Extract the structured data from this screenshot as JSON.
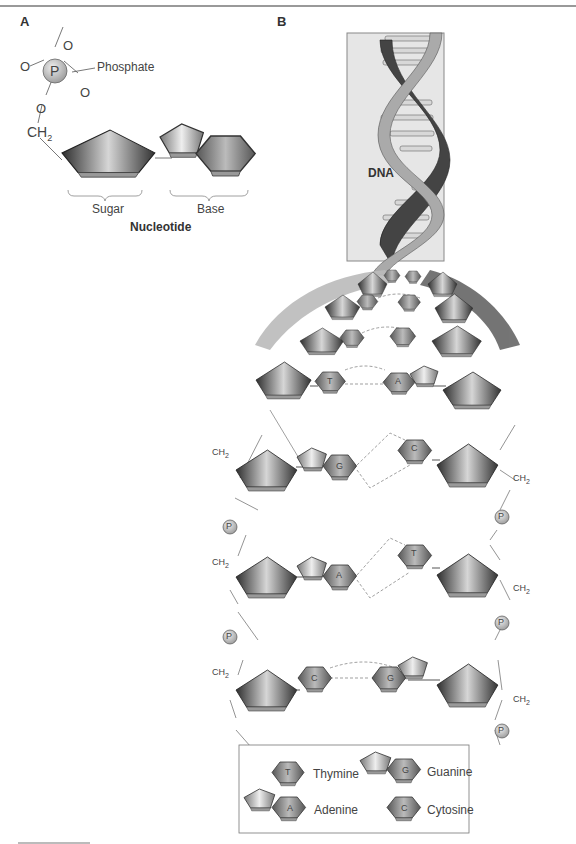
{
  "panels": {
    "a": "A",
    "b": "B"
  },
  "nucleotide": {
    "phosphate_label": "Phosphate",
    "p_atom": "P",
    "o_atom": "O",
    "ch2": "CH",
    "ch2_sub": "2",
    "sugar_label": "Sugar",
    "base_label": "Base",
    "title": "Nucleotide"
  },
  "helix": {
    "label": "DNA"
  },
  "pairs": [
    {
      "left": "T",
      "right": "A"
    },
    {
      "left": "G",
      "right": "C"
    },
    {
      "left": "A",
      "right": "T"
    },
    {
      "left": "C",
      "right": "G"
    }
  ],
  "legend": {
    "items": [
      {
        "code": "T",
        "name": "Thymine"
      },
      {
        "code": "G",
        "name": "Guanine"
      },
      {
        "code": "A",
        "name": "Adenine"
      },
      {
        "code": "C",
        "name": "Cytosine"
      }
    ]
  },
  "colors": {
    "sugar_dark": "#3a3a3a",
    "sugar_light": "#bdbdbd",
    "phosphate": "#b8b8b8",
    "helix_box": "#e6e6e6",
    "strand_light": "#a8a8a8",
    "strand_dark": "#444444"
  }
}
